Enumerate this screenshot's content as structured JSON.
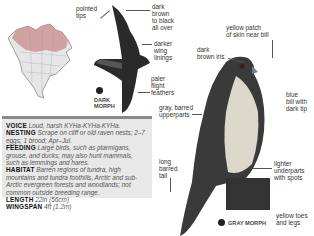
{
  "dark_morph": {
    "label_line1": "DARK",
    "label_line2": "MORPH",
    "annotations": {
      "pointed_tips": [
        "pointed",
        "tips"
      ],
      "dark_brown": [
        "dark",
        "brown",
        "to black",
        "all over"
      ],
      "darker_wing": [
        "darker",
        "wing",
        "linings"
      ],
      "paler_flight": [
        "paler",
        "flight",
        "feathers"
      ]
    }
  },
  "gray_morph": {
    "label": "GRAY MORPH",
    "annotations": {
      "yellow_patch": [
        "yellow patch",
        "of skin near bill"
      ],
      "dark_iris": [
        "dark",
        "brown iris"
      ],
      "blue_bill": [
        "blue",
        "bill with",
        "dark tip"
      ],
      "gray_upper": [
        "gray, barred",
        "upperparts"
      ],
      "long_tail": [
        "long",
        "barred",
        "tail"
      ],
      "lighter_under": [
        "lighter",
        "underparts",
        "with spots"
      ],
      "yellow_toes": [
        "yellow toes",
        "and legs"
      ]
    }
  },
  "info": {
    "voice": {
      "key": "VOICE",
      "text": "Loud, harsh KYHa-KYHa-KYHa."
    },
    "nesting": {
      "key": "NESTING",
      "text": "Scrape on cliff or old raven nests; 2–7 eggs; 1 brood; Apr–Jul."
    },
    "feeding": {
      "key": "FEEDING",
      "text": "Large birds, such as ptarmigans, grouse, and ducks; may also hunt mammals, such as lemmings and hares."
    },
    "habitat": {
      "key": "HABITAT",
      "text": "Barren regions of tundra, high mountains and tundra foothills, Arctic and sub-Arctic evergreen forests and woodlands; not common outside breeding range."
    },
    "length": {
      "key": "LENGTH",
      "text": "22in (56cm)"
    },
    "wingspan": {
      "key": "WINGSPAN",
      "text": "4ft (1.2m)"
    }
  },
  "colors": {
    "info_bg": "#e8e8e8",
    "info_bar": "#8a8a8a",
    "map_range": "#c98b8b"
  }
}
